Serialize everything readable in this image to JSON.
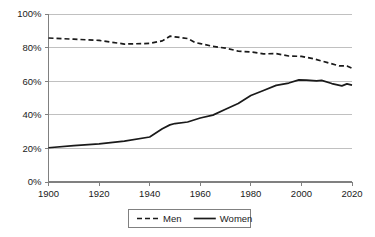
{
  "chart_data": {
    "type": "line",
    "title": "",
    "subtitle": "",
    "xlabel": "",
    "ylabel": "",
    "xlim": [
      1900,
      2020
    ],
    "ylim": [
      0,
      100
    ],
    "grid": "horizontal",
    "legend_position": "bottom",
    "x_ticks": [
      "1900",
      "1920",
      "1940",
      "1960",
      "1980",
      "2000",
      "2020"
    ],
    "x_tick_values": [
      1900,
      1920,
      1940,
      1960,
      1980,
      2000,
      2020
    ],
    "y_ticks": [
      "0%",
      "20%",
      "40%",
      "60%",
      "80%",
      "100%"
    ],
    "y_tick_values": [
      0,
      20,
      40,
      60,
      80,
      100
    ],
    "series": [
      {
        "name": "Men",
        "style": "dashed",
        "color": "#1a1a1a",
        "x": [
          1900,
          1910,
          1920,
          1930,
          1940,
          1945,
          1948,
          1950,
          1955,
          1958,
          1960,
          1965,
          1970,
          1975,
          1980,
          1985,
          1990,
          1995,
          2000,
          2005,
          2010,
          2015,
          2018,
          2020
        ],
        "values": [
          85.7,
          85.0,
          84.3,
          82.1,
          82.5,
          84.0,
          86.8,
          86.4,
          85.4,
          83.0,
          82.4,
          80.7,
          79.7,
          77.9,
          77.4,
          76.3,
          76.4,
          75.0,
          74.8,
          73.3,
          71.2,
          69.1,
          69.1,
          67.7
        ]
      },
      {
        "name": "Women",
        "style": "solid",
        "color": "#1a1a1a",
        "x": [
          1900,
          1910,
          1920,
          1930,
          1940,
          1945,
          1948,
          1950,
          1955,
          1960,
          1965,
          1970,
          1975,
          1980,
          1985,
          1990,
          1995,
          1999,
          2002,
          2006,
          2008,
          2012,
          2016,
          2018,
          2020
        ],
        "values": [
          20.4,
          21.6,
          22.7,
          24.3,
          26.8,
          31.7,
          34.0,
          34.8,
          35.7,
          38.1,
          39.8,
          43.3,
          46.7,
          51.5,
          54.5,
          57.5,
          58.9,
          60.8,
          60.6,
          60.2,
          60.5,
          58.6,
          57.2,
          58.4,
          57.7
        ]
      }
    ],
    "legend": [
      {
        "label": "Men",
        "style": "dashed"
      },
      {
        "label": "Women",
        "style": "solid"
      }
    ]
  },
  "colors": {
    "background": "#ffffff",
    "gridline": "#b0b0b0",
    "axis": "#808080",
    "line": "#1a1a1a",
    "text": "#1a1a1a"
  }
}
